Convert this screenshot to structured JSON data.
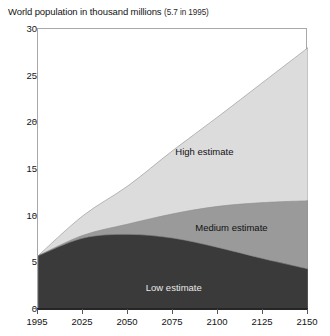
{
  "chart_data": {
    "type": "area",
    "title": "World population in thousand millions",
    "title_note": "(5.7 in 1995)",
    "xlabel": "",
    "ylabel": "",
    "stacked": false,
    "grid": false,
    "legend_position": "inline-labels",
    "x": [
      1995,
      2025,
      2050,
      2075,
      2100,
      2125,
      2150
    ],
    "xlim": [
      1995,
      2150
    ],
    "ylim": [
      0,
      30
    ],
    "yticks": [
      0,
      5,
      10,
      15,
      20,
      25,
      30
    ],
    "xticks": [
      1995,
      2025,
      2050,
      2075,
      2100,
      2125,
      2150
    ],
    "ytick_labels": [
      "0",
      "5",
      "10",
      "15",
      "20",
      "25",
      "30"
    ],
    "xtick_labels": [
      "1995",
      "2025",
      "2050",
      "2075",
      "2100",
      "2125",
      "2150"
    ],
    "series": [
      {
        "name": "High estimate",
        "color": "#dcdcdc",
        "label_x": 2093,
        "label_y": 16.8,
        "values": [
          5.7,
          10.0,
          13.2,
          17.0,
          20.6,
          24.3,
          28.0
        ]
      },
      {
        "name": "Medium estimate",
        "color": "#9a9a9a",
        "label_x": 2108,
        "label_y": 8.7,
        "values": [
          5.7,
          7.9,
          9.1,
          10.2,
          11.0,
          11.4,
          11.6
        ]
      },
      {
        "name": "Low estimate",
        "color": "#3a3a3a",
        "label_x": 2076,
        "label_y": 2.3,
        "values": [
          5.7,
          7.6,
          8.0,
          7.6,
          6.6,
          5.4,
          4.3
        ]
      }
    ]
  },
  "colors": {
    "high": "#dcdcdc",
    "medium": "#9a9a9a",
    "low": "#3a3a3a",
    "frame": "#a8a8a8",
    "axis": "#262626",
    "text": "#141414"
  }
}
